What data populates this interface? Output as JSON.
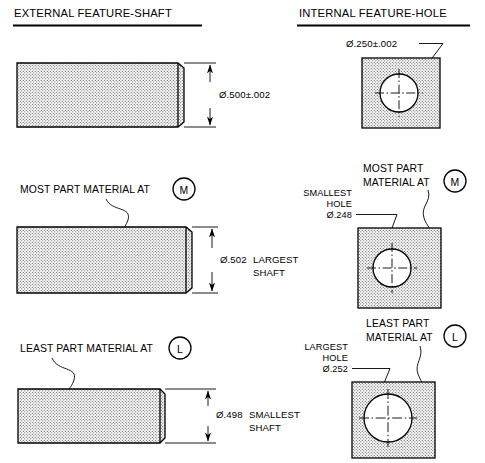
{
  "document": {
    "kind": "engineering-drawing",
    "subject": "Material condition modifiers MMC and LMC for external (shaft) and internal (hole) features"
  },
  "columns": {
    "left": {
      "heading": "EXTERNAL FEATURE-SHAFT",
      "rows": [
        {
          "id": "shaft-nominal",
          "callout": "",
          "modifier_symbol": "",
          "dimension": "Ø.500±.002",
          "dimension_note": ""
        },
        {
          "id": "shaft-mmc",
          "callout": "MOST PART MATERIAL AT",
          "modifier_symbol": "M",
          "dimension": "Ø.502",
          "dimension_note_line1": "LARGEST",
          "dimension_note_line2": "SHAFT"
        },
        {
          "id": "shaft-lmc",
          "callout": "LEAST PART MATERIAL AT",
          "modifier_symbol": "L",
          "dimension": "Ø.498",
          "dimension_note_line1": "SMALLEST",
          "dimension_note_line2": "SHAFT"
        }
      ]
    },
    "right": {
      "heading": "INTERNAL FEATURE-HOLE",
      "rows": [
        {
          "id": "hole-nominal",
          "dimension": "Ø.250±.002",
          "callout_line1": "",
          "callout_line2": "",
          "modifier_symbol": "",
          "feature_note_line1": "",
          "feature_note_line2": "",
          "feature_note_dim": ""
        },
        {
          "id": "hole-mmc",
          "callout_line1": "MOST PART",
          "callout_line2": "MATERIAL AT",
          "modifier_symbol": "M",
          "feature_note_line1": "SMALLEST",
          "feature_note_line2": "HOLE",
          "feature_note_dim": "Ø.248"
        },
        {
          "id": "hole-lmc",
          "callout_line1": "LEAST PART",
          "callout_line2": "MATERIAL AT",
          "modifier_symbol": "L",
          "feature_note_line1": "LARGEST",
          "feature_note_line2": "HOLE",
          "feature_note_dim": "Ø.252"
        }
      ]
    }
  },
  "colors": {
    "ink": "#000000",
    "paper": "#ffffff",
    "hatch": "#808080"
  }
}
